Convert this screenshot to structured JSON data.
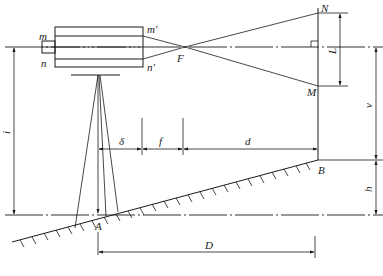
{
  "figure": {
    "labels": {
      "m": "m",
      "n": "n",
      "m_prime": "m′",
      "n_prime": "n′",
      "F": "F",
      "N": "N",
      "M": "M",
      "L": "L",
      "i": "i",
      "v": "v",
      "h": "h",
      "delta": "δ",
      "f": "f",
      "d": "d",
      "D": "D",
      "A": "A",
      "B": "B"
    },
    "colors": {
      "stroke": "#1a1a1a",
      "background": "#ffffff"
    }
  }
}
